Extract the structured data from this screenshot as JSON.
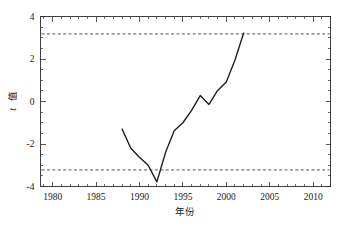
{
  "chart_data": {
    "type": "line",
    "title": "",
    "xlabel": "年份",
    "ylabel": "t 值",
    "ylabel_italic_part": "t",
    "ylabel_cjk_part": "值",
    "xlim": [
      1978.6,
      1992.0
    ],
    "ylim": [
      -4,
      4
    ],
    "xlim_actual": [
      1978.6,
      2012.0
    ],
    "grid": false,
    "legend": null,
    "x_ticks": [
      1980,
      1985,
      1990,
      1995,
      2000,
      2005,
      2010
    ],
    "x_tick_labels": [
      "1980",
      "1985",
      "1990",
      "1995",
      "2000",
      "2005",
      "2010"
    ],
    "x_minor_tick_step": 1,
    "y_ticks": [
      -4,
      -2,
      0,
      2,
      4
    ],
    "y_tick_labels": [
      "-4",
      "-2",
      "0",
      "2",
      "4"
    ],
    "y_minor_tick_step": 0.5,
    "series": [
      {
        "name": "t 值",
        "x": [
          1988,
          1989,
          1990,
          1991,
          1992,
          1993,
          1994,
          1995,
          1996,
          1997,
          1998,
          1999,
          2000,
          2001,
          2002
        ],
        "values": [
          -1.3,
          -2.2,
          -2.62,
          -3.0,
          -3.78,
          -2.4,
          -1.38,
          -1.0,
          -0.42,
          0.28,
          -0.14,
          0.52,
          0.92,
          1.95,
          3.22
        ]
      }
    ],
    "annotations": [
      {
        "type": "hline",
        "name": "upper-critical-value",
        "y": 3.18,
        "style": "dashed",
        "color": "#3b3b6b"
      },
      {
        "type": "hline",
        "name": "lower-critical-value",
        "y": -3.22,
        "style": "dashed",
        "color": "#3b3b6b"
      }
    ],
    "colors": {
      "line": "#1b1b1b",
      "threshold": "#3b3b6b",
      "frame": "#2b2b2b",
      "background": "#ffffff",
      "text": "#1a1a1a"
    }
  }
}
